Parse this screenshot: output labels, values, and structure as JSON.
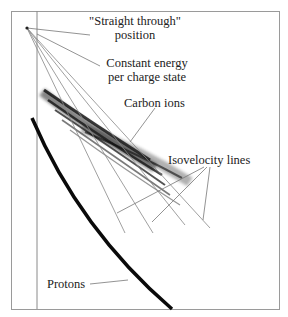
{
  "figure": {
    "type": "annotated spectrometer detector image",
    "labels": {
      "straight_through_line1": "\"Straight through\"",
      "straight_through_line2": "position",
      "constant_energy_line1": "Constant energy",
      "constant_energy_line2": "per charge state",
      "carbon_ions": "Carbon ions",
      "isovelocity": "Isovelocity lines",
      "protons": "Protons"
    },
    "colors": {
      "background": "#ffffff",
      "frame": "#9a9a9a",
      "lines": "#7a7a7a",
      "traces": "#111111",
      "text": "#222222"
    }
  }
}
